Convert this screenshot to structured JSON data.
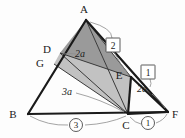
{
  "figure": {
    "background": "#fdfdfd",
    "colors": {
      "outline": "#1a1a1a",
      "thin_line": "#3a3a3a",
      "leader": "#8d8d8d",
      "shade_dark": "#9a9a9a",
      "shade_light": "#c2c2c2",
      "shade_mid": "#adadad"
    },
    "points": {
      "A": {
        "label": "A",
        "x": 86,
        "y": 20,
        "label_x": 84,
        "label_y": 12
      },
      "B": {
        "label": "B",
        "x": 28,
        "y": 114,
        "label_x": 13,
        "label_y": 116
      },
      "C": {
        "label": "C",
        "x": 128,
        "y": 114,
        "label_x": 126,
        "label_y": 127
      },
      "D": {
        "label": "D",
        "x": 60,
        "y": 53,
        "label_x": 46,
        "label_y": 51
      },
      "E": {
        "label": "E",
        "x": 131,
        "y": 77,
        "label_x": 117,
        "label_y": 76
      },
      "F": {
        "label": "F",
        "x": 168,
        "y": 112,
        "label_x": 172,
        "label_y": 116
      },
      "G": {
        "label": "G",
        "x": 54,
        "y": 64,
        "label_x": 39,
        "label_y": 64
      }
    },
    "segment_labels": [
      {
        "name": "ad-de-ratio",
        "text": "2a",
        "x": 80,
        "y": 56
      },
      {
        "name": "gc-length",
        "text": "3a",
        "x": 67,
        "y": 94
      },
      {
        "name": "ef-length",
        "text": "2a",
        "x": 142,
        "y": 91
      }
    ],
    "boxed_labels": [
      {
        "name": "region-2",
        "text": "2",
        "x": 113,
        "y": 45
      },
      {
        "name": "region-1",
        "text": "1",
        "x": 148,
        "y": 72
      }
    ],
    "circled_labels": [
      {
        "name": "ratio-3",
        "text": "3",
        "x": 76,
        "y": 125
      },
      {
        "name": "ratio-1",
        "text": "1",
        "x": 148,
        "y": 123
      }
    ]
  }
}
